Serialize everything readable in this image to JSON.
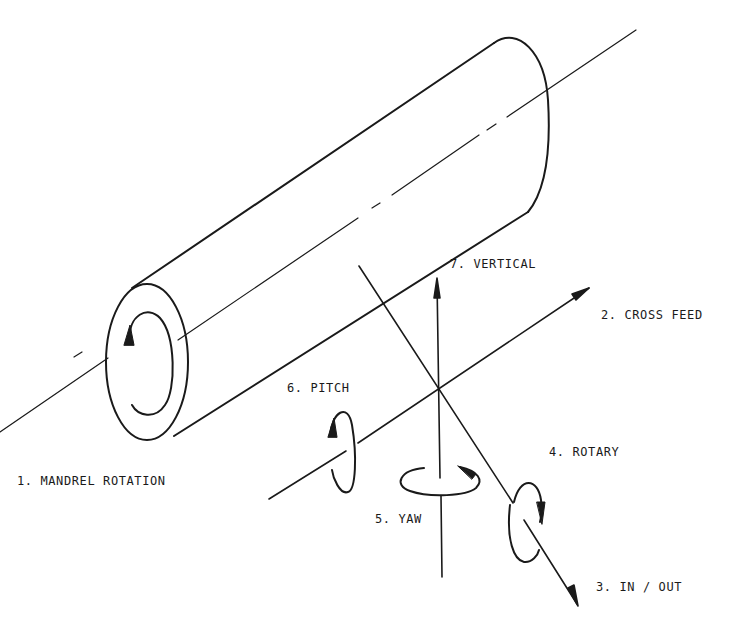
{
  "diagram": {
    "colors": {
      "ink": "#1a1a1a",
      "background": "#ffffff"
    },
    "labels": {
      "mandrel_rotation": "1. MANDREL ROTATION",
      "cross_feed": "2. CROSS FEED",
      "in_out": "3. IN / OUT",
      "rotary": "4. ROTARY",
      "yaw": "5. YAW",
      "pitch": "6. PITCH",
      "vertical": "7. VERTICAL"
    },
    "axes": [
      {
        "id": 1,
        "name": "MANDREL ROTATION",
        "type": "rotation"
      },
      {
        "id": 2,
        "name": "CROSS FEED",
        "type": "translation"
      },
      {
        "id": 3,
        "name": "IN / OUT",
        "type": "translation"
      },
      {
        "id": 4,
        "name": "ROTARY",
        "type": "rotation"
      },
      {
        "id": 5,
        "name": "YAW",
        "type": "rotation"
      },
      {
        "id": 6,
        "name": "PITCH",
        "type": "rotation"
      },
      {
        "id": 7,
        "name": "VERTICAL",
        "type": "translation"
      }
    ]
  }
}
